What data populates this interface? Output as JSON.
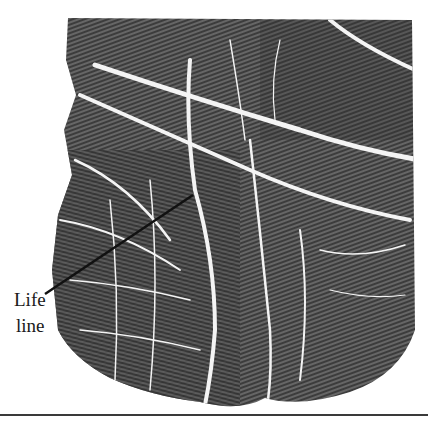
{
  "figure": {
    "annotation": {
      "label_line1": "Life",
      "label_line2": "line",
      "leader_from": [
        45,
        294
      ],
      "leader_to": [
        193,
        195
      ]
    },
    "colors": {
      "ink": "#2b2b2b",
      "background": "#ffffff",
      "creases": "#f2f2f2",
      "leader": "#111111",
      "rule": "#3a3a3a"
    }
  }
}
